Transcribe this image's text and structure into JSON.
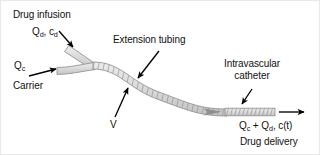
{
  "figure": {
    "background_color": "#ffffff",
    "tubing_fill": "#d9d9d9",
    "tubing_stroke": "#7a7a7a",
    "arrow_color": "#000000",
    "flow_arrow_color": "#8f8f8f"
  },
  "labels": {
    "drug_infusion": "Drug infusion",
    "drug_infusion_flow_q": "Q",
    "drug_infusion_flow_q_sub": "d",
    "drug_infusion_sep": ", c",
    "drug_infusion_conc_sub": "d",
    "carrier_flow_q": "Q",
    "carrier_flow_q_sub": "c",
    "carrier": "Carrier",
    "extension_tubing": "Extension tubing",
    "junction_v": "V",
    "intravascular": "Intravascular",
    "catheter": "catheter",
    "delivery_eq_q1": "Q",
    "delivery_eq_q1_sub": "c",
    "delivery_eq_plus": " + Q",
    "delivery_eq_q2_sub": "d",
    "delivery_eq_conc": ", c(t)",
    "drug_delivery": "Drug delivery"
  },
  "icons": {
    "pointer_drug_infusion": "arrow-down-right-icon",
    "pointer_carrier": "arrow-right-icon",
    "pointer_extension": "arrow-down-left-icon",
    "pointer_v": "arrow-up-right-icon",
    "pointer_catheter": "arrow-down-left-icon",
    "outflow": "arrow-right-icon",
    "flow_direction": "flow-arrow-icon"
  }
}
